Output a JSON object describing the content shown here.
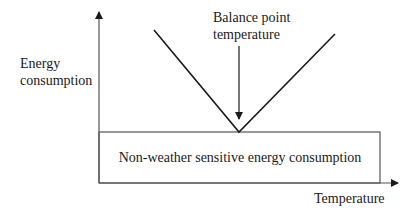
{
  "diagram": {
    "y_axis_label_line1": "Energy",
    "y_axis_label_line2": "consumption",
    "x_axis_label": "Temperature",
    "balance_point_label_line1": "Balance point",
    "balance_point_label_line2": "temperature",
    "baseload_box_label": "Non-weather sensitive energy consumption",
    "colors": {
      "line": "#1a1a1a",
      "axis": "#555555",
      "background": "#ffffff"
    }
  }
}
